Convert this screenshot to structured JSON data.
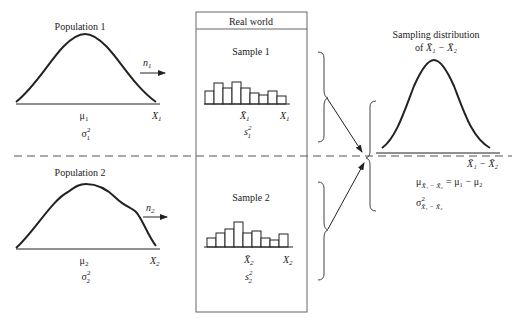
{
  "populations": [
    {
      "title": "Population 1",
      "mean_label": "μ",
      "mean_sub": "1",
      "variance_label": "σ",
      "variance_sup": "2",
      "variance_sub": "1",
      "axis_label": "X",
      "axis_sub": "1",
      "sample_size_label": "n",
      "sample_size_sub": "1",
      "shape": "symmetric bell curve"
    },
    {
      "title": "Population 2",
      "mean_label": "μ",
      "mean_sub": "2",
      "variance_label": "σ",
      "variance_sup": "2",
      "variance_sub": "2",
      "axis_label": "X",
      "axis_sub": "2",
      "sample_size_label": "n",
      "sample_size_sub": "2",
      "shape": "skewed curve with right shoulder"
    }
  ],
  "real_world": {
    "header": "Real world",
    "samples": [
      {
        "title": "Sample 1",
        "mean_label": "X̄",
        "mean_sub": "1",
        "axis_label": "X",
        "axis_sub": "1",
        "variance_label": "s",
        "variance_sup": "2",
        "variance_sub": "1",
        "histogram_heights": [
          13,
          21,
          16,
          22,
          16,
          11,
          9,
          13,
          8
        ]
      },
      {
        "title": "Sample 2",
        "mean_label": "X̄",
        "mean_sub": "2",
        "axis_label": "X",
        "axis_sub": "2",
        "variance_label": "s",
        "variance_sup": "2",
        "variance_sub": "2",
        "histogram_heights": [
          9,
          14,
          18,
          25,
          14,
          16,
          9,
          7,
          13
        ]
      }
    ]
  },
  "sampling_distribution": {
    "title_line1": "Sampling distribution",
    "title_line2_prefix": "of ",
    "title_expr": "X̄₁ − X̄₂",
    "axis_label": "X̄₁ − X̄₂",
    "mean_formula_lhs": "μ",
    "mean_formula_sub": "X̄₁ − X̄₂",
    "mean_formula_rhs": "= μ₁ − μ₂",
    "variance_formula": "σ",
    "variance_sup": "2",
    "variance_sub": "X̄₁ − X̄₂"
  }
}
